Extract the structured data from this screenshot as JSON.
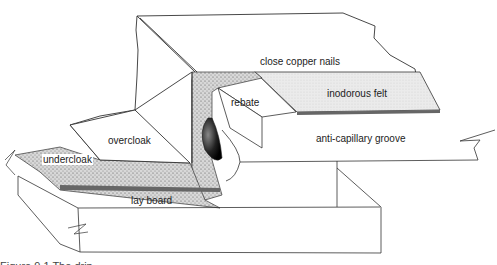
{
  "figure": {
    "type": "cutaway technical illustration",
    "labels": {
      "close_copper_nails": "close copper nails",
      "rebate": "rebate",
      "inodorous_felt": "inodorous felt",
      "overcloak": "overcloak",
      "undercloak": "undercloak",
      "anti_capillary_groove": "anti-capillary groove",
      "lay_board": "lay board"
    },
    "caption_fragment": "Figure 9.1 The drip"
  },
  "colors": {
    "line": "#333333",
    "felt_fill": "#e6e6e6",
    "stipple_dark": "#555555",
    "background": "#ffffff"
  }
}
